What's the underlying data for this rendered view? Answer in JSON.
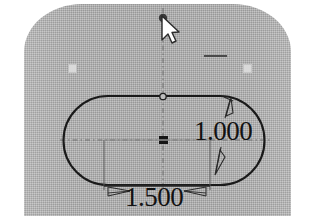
{
  "app": {
    "view_name": "cad-sketch-viewport",
    "background_color": "#ffffff",
    "part_face_color": "#a9a9a9",
    "sketch_line_color": "#1a1a1a",
    "dimension_color": "#121212"
  },
  "sketch": {
    "profile_name": "slot",
    "origin_marker_label": "",
    "top_vertex_label": "",
    "relations": {
      "horizontal_relation_label": ""
    }
  },
  "dimensions": [
    {
      "id": "vertical-dimension",
      "value": "1.000",
      "orientation": "vertical",
      "arrowheads": 2
    },
    {
      "id": "horizontal-dimension",
      "value": "1.500",
      "orientation": "horizontal",
      "arrowheads": 2
    }
  ],
  "cursor": {
    "name": "mouse-pointer",
    "x": 162,
    "y": 17
  },
  "handles": [
    {
      "id": "handle-left",
      "label": ""
    },
    {
      "id": "handle-right",
      "label": ""
    }
  ]
}
